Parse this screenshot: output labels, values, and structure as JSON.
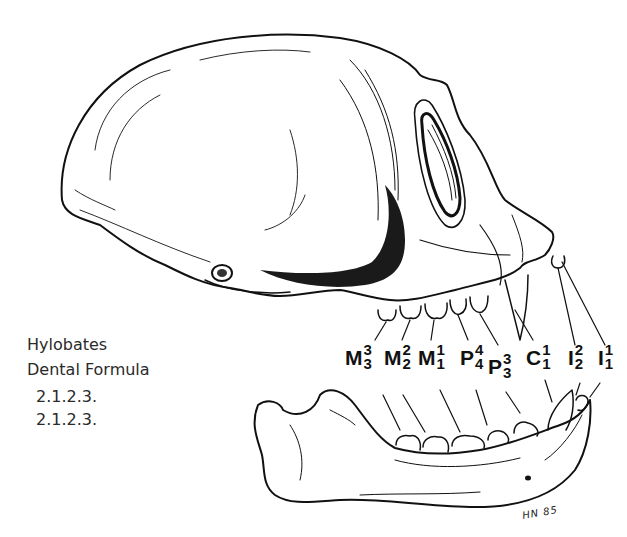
{
  "figure": {
    "caption": {
      "genus": "Hylobates",
      "title": "Dental Formula",
      "upper_formula": "2.1.2.3.",
      "lower_formula": "2.1.2.3."
    },
    "tooth_labels": [
      {
        "letter": "M",
        "upper": "3",
        "lower": "3",
        "name": "third molar"
      },
      {
        "letter": "M",
        "upper": "2",
        "lower": "2",
        "name": "second molar"
      },
      {
        "letter": "M",
        "upper": "1",
        "lower": "1",
        "name": "first molar"
      },
      {
        "letter": "P",
        "upper": "4",
        "lower": "4",
        "name": "fourth premolar"
      },
      {
        "letter": "P",
        "upper": "3",
        "lower": "3",
        "name": "third premolar"
      },
      {
        "letter": "C",
        "upper": "1",
        "lower": "1",
        "name": "canine"
      },
      {
        "letter": "I",
        "upper": "2",
        "lower": "2",
        "name": "second incisor"
      },
      {
        "letter": "I",
        "upper": "1",
        "lower": "1",
        "name": "first incisor"
      }
    ],
    "signature": "HN 85",
    "colors": {
      "ink": "#111111",
      "background": "#ffffff",
      "caption_text": "#2a2a2a"
    }
  }
}
